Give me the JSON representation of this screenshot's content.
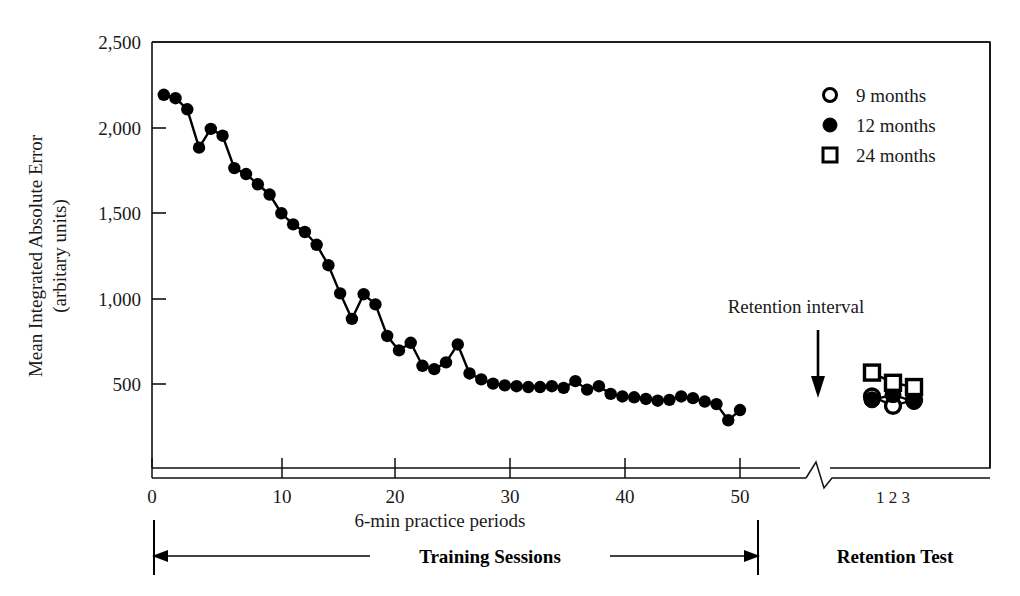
{
  "chart_data": {
    "type": "line",
    "title": "",
    "xlabel": "6-min practice periods",
    "ylabel": "Mean Integrated Absolute Error\n(arbitary units)",
    "ylabel_line1": "Mean Integrated Absolute Error",
    "ylabel_line2": "(arbitary units)",
    "xlim": [
      0,
      51
    ],
    "ylim": [
      0,
      2500
    ],
    "grid": false,
    "legend_position": "top-right",
    "y_ticks": [
      500,
      1000,
      1500,
      2000,
      2500
    ],
    "y_tick_labels": [
      "500",
      "1,000",
      "1,500",
      "2,000",
      "2,500"
    ],
    "x_ticks": [
      0,
      10,
      20,
      30,
      40,
      50
    ],
    "x_tick_labels": [
      "0",
      "10",
      "20",
      "30",
      "40",
      "50"
    ],
    "axis_break": true,
    "legend": [
      {
        "label": "9 months",
        "marker": "open-circle"
      },
      {
        "label": "12 months",
        "marker": "filled-circle"
      },
      {
        "label": "24 months",
        "marker": "open-square"
      }
    ],
    "annotations": [
      {
        "text": "Retention interval",
        "type": "arrow-label"
      },
      {
        "text": "Training Sessions",
        "type": "phase-bracket"
      },
      {
        "text": "Retention Test",
        "type": "phase-label"
      },
      {
        "text": "1 2 3",
        "type": "retention-trial-axis"
      }
    ],
    "retention_trial_labels": [
      "1",
      "2",
      "3"
    ],
    "series": [
      {
        "name": "Training (acquisition)",
        "marker": "filled-circle",
        "x": [
          1,
          2,
          3,
          4,
          5,
          6,
          7,
          8,
          9,
          10,
          11,
          12,
          13,
          14,
          15,
          16,
          17,
          18,
          19,
          20,
          21,
          22,
          23,
          24,
          25,
          26,
          27,
          28,
          29,
          30,
          31,
          32,
          33,
          34,
          35,
          36,
          37,
          38,
          39,
          40,
          41,
          42,
          43,
          44,
          45,
          46,
          47,
          48,
          49,
          50
        ],
        "values": [
          2190,
          2170,
          2105,
          1880,
          1990,
          1950,
          1760,
          1725,
          1665,
          1605,
          1495,
          1430,
          1385,
          1310,
          1190,
          1025,
          875,
          1020,
          960,
          775,
          690,
          735,
          600,
          580,
          620,
          725,
          555,
          520,
          495,
          485,
          480,
          475,
          475,
          480,
          470,
          510,
          460,
          480,
          435,
          420,
          415,
          405,
          395,
          400,
          420,
          410,
          390,
          375,
          280,
          340
        ]
      },
      {
        "name": "9 months",
        "marker": "open-circle",
        "x": [
          1,
          2,
          3
        ],
        "values": [
          420,
          365,
          400
        ]
      },
      {
        "name": "12 months",
        "marker": "filled-circle",
        "x": [
          1,
          2,
          3
        ],
        "values": [
          400,
          430,
          390
        ]
      },
      {
        "name": "24 months",
        "marker": "open-square",
        "x": [
          1,
          2,
          3
        ],
        "values": [
          560,
          500,
          475
        ]
      }
    ]
  }
}
